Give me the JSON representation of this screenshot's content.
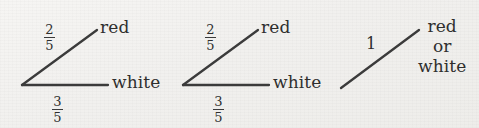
{
  "figure": {
    "background_color": "#f3f2f0",
    "ink_color": "#3b3b3b",
    "width": 479,
    "height": 128
  },
  "diagrams": [
    {
      "id": "tree-1",
      "left": 0,
      "root_x": 22,
      "root_y": 85,
      "branches": [
        {
          "id": "upper",
          "weight_kind": "fraction",
          "numerator": "2",
          "denominator": "5",
          "weight_text": "2/5",
          "weight_x": 50,
          "weight_y": 26,
          "outcome": "red",
          "outcome_x": 100,
          "outcome_y": 20,
          "x1": 22,
          "y1": 85,
          "x2": 97,
          "y2": 30
        },
        {
          "id": "lower",
          "weight_kind": "fraction",
          "numerator": "3",
          "denominator": "5",
          "weight_text": "3/5",
          "weight_x": 58,
          "weight_y": 95,
          "outcome": "white",
          "outcome_x": 112,
          "outcome_y": 75,
          "x1": 22,
          "y1": 85,
          "x2": 108,
          "y2": 85
        }
      ]
    },
    {
      "id": "tree-2",
      "left": 161,
      "root_x": 183,
      "root_y": 85,
      "branches": [
        {
          "id": "upper",
          "weight_kind": "fraction",
          "numerator": "2",
          "denominator": "5",
          "weight_text": "2/5",
          "weight_x": 211,
          "weight_y": 26,
          "outcome": "red",
          "outcome_x": 261,
          "outcome_y": 20,
          "x1": 183,
          "y1": 85,
          "x2": 258,
          "y2": 30
        },
        {
          "id": "lower",
          "weight_kind": "fraction",
          "numerator": "3",
          "denominator": "5",
          "weight_text": "3/5",
          "weight_x": 219,
          "weight_y": 95,
          "outcome": "white",
          "outcome_x": 273,
          "outcome_y": 75,
          "x1": 183,
          "y1": 85,
          "x2": 269,
          "y2": 85
        }
      ]
    },
    {
      "id": "tree-3",
      "left": 330,
      "root_x": 341,
      "root_y": 88,
      "branches": [
        {
          "id": "only",
          "weight_kind": "integer",
          "weight_text": "1",
          "weight_x": 368,
          "weight_y": 37,
          "outcome_line_1": "red or",
          "outcome_line_2": "white",
          "outcome_x": 420,
          "outcome_y": 18,
          "x1": 341,
          "y1": 88,
          "x2": 419,
          "y2": 30
        }
      ]
    }
  ]
}
